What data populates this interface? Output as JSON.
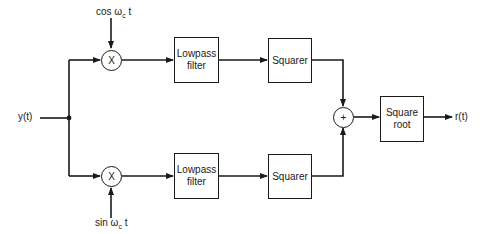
{
  "diagram": {
    "type": "block-diagram",
    "input": {
      "label": "y(t)"
    },
    "output": {
      "label": "r(t)"
    },
    "upper_branch": {
      "carrier": {
        "prefix": "cos ω",
        "sub": "c",
        "suffix": " t"
      },
      "multiplier_symbol": "X",
      "lowpass": {
        "line1": "Lowpass",
        "line2": "filter"
      },
      "squarer": {
        "label": "Squarer"
      }
    },
    "lower_branch": {
      "carrier": {
        "prefix": "sin ω",
        "sub": "c",
        "suffix": " t"
      },
      "multiplier_symbol": "X",
      "lowpass": {
        "line1": "Lowpass",
        "line2": "filter"
      },
      "squarer": {
        "label": "Squarer"
      }
    },
    "summer_symbol": "+",
    "square_root": {
      "line1": "Square",
      "line2": "root"
    }
  }
}
